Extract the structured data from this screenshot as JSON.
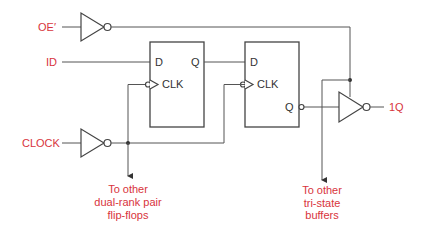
{
  "diagram": {
    "type": "logic-circuit",
    "inputs": {
      "oe": "OE′",
      "id": "ID",
      "clock": "CLOCK"
    },
    "output": "1Q",
    "flipflop1": {
      "d": "D",
      "q": "Q",
      "clk": "CLK"
    },
    "flipflop2": {
      "d": "D",
      "q": "Q",
      "clk": "CLK"
    },
    "notes": {
      "ff_note": [
        "To other",
        "dual-rank pair",
        "flip-flops"
      ],
      "buffer_note": [
        "To other",
        "tri-state",
        "buffers"
      ]
    },
    "colors": {
      "label": "#d8343c",
      "wire": "#555555"
    }
  }
}
